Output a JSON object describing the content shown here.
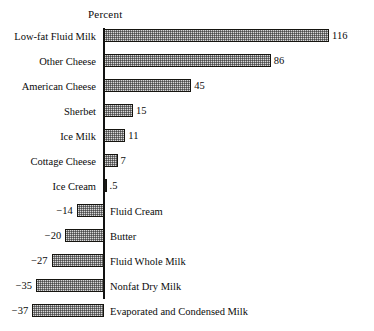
{
  "chart_data": {
    "type": "bar",
    "orientation": "horizontal",
    "title": "",
    "xlabel": "Percent",
    "ylabel": "",
    "axis_title": "Percent",
    "grid": false,
    "legend": "none",
    "zero_line": 0,
    "xlim": [
      -40,
      120
    ],
    "categories": [
      "Low-fat Fluid Milk",
      "Other Cheese",
      "American Cheese",
      "Sherbet",
      "Ice Milk",
      "Cottage Cheese",
      "Ice Cream",
      "Fluid Cream",
      "Butter",
      "Fluid Whole Milk",
      "Nonfat Dry Milk",
      "Evaporated and Condensed Milk"
    ],
    "values": [
      116,
      86,
      45,
      15,
      11,
      7,
      0.5,
      -14,
      -20,
      -27,
      -35,
      -37
    ],
    "value_labels": [
      "116",
      "86",
      "45",
      "15",
      "11",
      "7",
      ".5",
      "−14",
      "−20",
      "−27",
      "−35",
      "−37"
    ],
    "bars": [
      {
        "label": "Low-fat Fluid Milk",
        "value": 116,
        "value_label": "116",
        "sign": "positive"
      },
      {
        "label": "Other Cheese",
        "value": 86,
        "value_label": "86",
        "sign": "positive"
      },
      {
        "label": "American Cheese",
        "value": 45,
        "value_label": "45",
        "sign": "positive"
      },
      {
        "label": "Sherbet",
        "value": 15,
        "value_label": "15",
        "sign": "positive"
      },
      {
        "label": "Ice Milk",
        "value": 11,
        "value_label": "11",
        "sign": "positive"
      },
      {
        "label": "Cottage Cheese",
        "value": 7,
        "value_label": "7",
        "sign": "positive"
      },
      {
        "label": "Ice Cream",
        "value": 0.5,
        "value_label": ".5",
        "sign": "positive"
      },
      {
        "label": "Fluid Cream",
        "value": -14,
        "value_label": "−14",
        "sign": "negative"
      },
      {
        "label": "Butter",
        "value": -20,
        "value_label": "−20",
        "sign": "negative"
      },
      {
        "label": "Fluid Whole Milk",
        "value": -27,
        "value_label": "−27",
        "sign": "negative"
      },
      {
        "label": "Nonfat Dry Milk",
        "value": -35,
        "value_label": "−35",
        "sign": "negative"
      },
      {
        "label": "Evaporated and Condensed Milk",
        "value": -37,
        "value_label": "−37",
        "sign": "negative"
      }
    ],
    "colors": {
      "bar_fill": "#d8d8d8",
      "bar_edge": "#15140f",
      "axis": "#111111",
      "text": "#0b0b0b",
      "background": "#ffffff"
    }
  }
}
